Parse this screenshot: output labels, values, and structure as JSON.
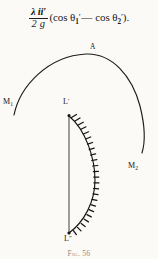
{
  "page": {
    "background_color": "#fbfaf7",
    "ink_color": "#1a1a18",
    "width": 158,
    "height": 259
  },
  "formula": {
    "full_text": "λ ii' / 2g (cos θ₁' — cos θ₂').",
    "numerator": "λ ii′",
    "denominator": "2 g",
    "open_paren": "(cos ",
    "theta_symbol_1": "θ",
    "theta_sub_1": "1",
    "theta_prime_1": "′",
    "dash": "—",
    "cos_2": " cos ",
    "theta_symbol_2": "θ",
    "theta_sub_2": "2",
    "theta_prime_2": "′",
    "close_paren": ").",
    "lambda": "λ",
    "ii_prime": "ii′",
    "two_g": "2 g"
  },
  "diagram": {
    "type": "physics-figure",
    "labels": {
      "arc_left_end": "M",
      "arc_left_end_sub": "1",
      "arc_right_end": "M",
      "arc_right_end_sub": "2",
      "arc_apex": "A",
      "coil_top": "L",
      "coil_top_prime": "′",
      "coil_bottom": "L",
      "coil_bottom_prime": "″"
    },
    "geometry": {
      "arc_start": [
        14,
        80
      ],
      "arc_apex_point": [
        88,
        20
      ],
      "arc_end": [
        142,
        118
      ],
      "chord_top": [
        69,
        81
      ],
      "chord_bottom": [
        69,
        199
      ],
      "coil_bulge_x": 95,
      "winding_tick_count": 23,
      "winding_tick_length": 5
    },
    "colors": {
      "stroke": "#1c1c1a",
      "winding": "#141413"
    }
  },
  "caption": {
    "prefix": "Fig.",
    "number": "56",
    "full": "Fig. 56"
  }
}
